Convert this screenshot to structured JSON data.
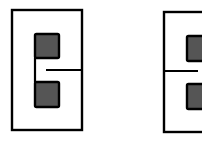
{
  "diagram": {
    "colors": {
      "stroke": "#000000",
      "fill_square": "#555555",
      "background": "#ffffff"
    },
    "figures": [
      {
        "name": "left-figure",
        "outer": {
          "x": 12,
          "y": 10,
          "w": 70,
          "h": 120
        },
        "squares": [
          {
            "x": 35,
            "y": 34,
            "w": 24,
            "h": 24
          },
          {
            "x": 35,
            "y": 82,
            "w": 24,
            "h": 25
          }
        ],
        "lines": [
          {
            "x1": 35,
            "y1": 58,
            "x2": 35,
            "y2": 82
          },
          {
            "x1": 46,
            "y1": 70,
            "x2": 82,
            "y2": 70
          }
        ]
      },
      {
        "name": "right-figure",
        "outer": {
          "x": 164,
          "y": 12,
          "w": 60,
          "h": 120
        },
        "squares": [
          {
            "x": 187,
            "y": 36,
            "w": 24,
            "h": 25
          },
          {
            "x": 187,
            "y": 84,
            "w": 24,
            "h": 25
          }
        ],
        "lines": [
          {
            "x1": 164,
            "y1": 71,
            "x2": 198,
            "y2": 71
          }
        ]
      }
    ]
  }
}
